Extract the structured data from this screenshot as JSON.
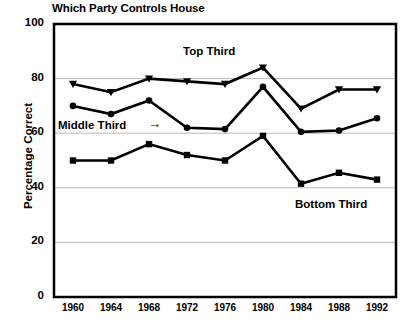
{
  "chart_data": {
    "type": "line",
    "title": "Which Party Controls House",
    "xlabel": "",
    "ylabel": "Percentage Correct",
    "x": [
      1960,
      1964,
      1968,
      1972,
      1976,
      1980,
      1984,
      1988,
      1992
    ],
    "categories": [
      "1960",
      "1964",
      "1968",
      "1972",
      "1976",
      "1980",
      "1984",
      "1988",
      "1992"
    ],
    "ylim": [
      0,
      100
    ],
    "yticks": [
      0,
      20,
      40,
      60,
      80,
      100
    ],
    "ytick_labels": [
      "0",
      "20",
      "40",
      "60",
      "80",
      "100"
    ],
    "grid": true,
    "legend": "inline-annotations",
    "series": [
      {
        "name": "Top Third",
        "marker": "triangle",
        "values": [
          78,
          75,
          80,
          79,
          78,
          84,
          69,
          76,
          76
        ]
      },
      {
        "name": "Middle Third",
        "marker": "circle",
        "values": [
          70,
          67,
          72,
          62,
          61.5,
          77,
          60.5,
          61,
          65.5
        ]
      },
      {
        "name": "Bottom Third",
        "marker": "square",
        "values": [
          50,
          50,
          56,
          52,
          50,
          59,
          41.5,
          45.5,
          43
        ]
      }
    ],
    "annotations": [
      {
        "text": "Top Third",
        "series": "Top Third"
      },
      {
        "text": "Middle Third",
        "series": "Middle Third",
        "arrow": "→"
      },
      {
        "text": "Bottom Third",
        "series": "Bottom Third"
      }
    ],
    "colors": {
      "line": "#000000",
      "grid": "#b8b8b8",
      "axis": "#000000",
      "background": "#ffffff"
    }
  }
}
